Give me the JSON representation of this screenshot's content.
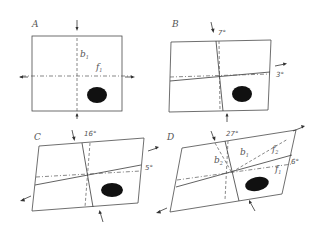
{
  "figure": {
    "panels": [
      {
        "id": "A",
        "label": "A",
        "axis_labels": {
          "b": "b",
          "b_sub": "1",
          "f": "f",
          "f_sub": "1"
        },
        "angles": []
      },
      {
        "id": "B",
        "label": "B",
        "angles": [
          "7°",
          "3°"
        ]
      },
      {
        "id": "C",
        "label": "C",
        "angles": [
          "16°",
          "5°"
        ]
      },
      {
        "id": "D",
        "label": "D",
        "angles": [
          "27°",
          "6°"
        ],
        "axis_labels": {
          "b2": "b",
          "b2_sub": "2",
          "b1": "b",
          "b1_sub": "1",
          "f2": "f",
          "f2_sub": "2",
          "f1": "f",
          "f1_sub": "1"
        }
      }
    ],
    "colors": {
      "line": "#3a3a3a",
      "fill_blob": "#111111",
      "background": "#ffffff"
    }
  }
}
